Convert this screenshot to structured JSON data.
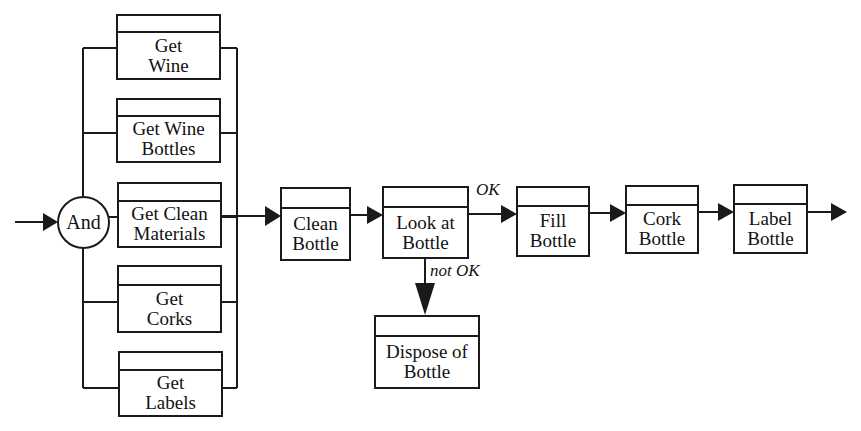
{
  "diagram": {
    "type": "process-flow",
    "join_node": {
      "label": "And"
    },
    "parallel_tasks": [
      {
        "id": "get-wine",
        "line1": "Get",
        "line2": "Wine"
      },
      {
        "id": "get-wine-bottles",
        "line1": "Get Wine",
        "line2": "Bottles"
      },
      {
        "id": "get-clean-materials",
        "line1": "Get Clean",
        "line2": "Materials"
      },
      {
        "id": "get-corks",
        "line1": "Get",
        "line2": "Corks"
      },
      {
        "id": "get-labels",
        "line1": "Get",
        "line2": "Labels"
      }
    ],
    "sequence": [
      {
        "id": "clean-bottle",
        "line1": "Clean",
        "line2": "Bottle"
      },
      {
        "id": "look-at-bottle",
        "line1": "Look at",
        "line2": "Bottle"
      },
      {
        "id": "fill-bottle",
        "line1": "Fill",
        "line2": "Bottle"
      },
      {
        "id": "cork-bottle",
        "line1": "Cork",
        "line2": "Bottle"
      },
      {
        "id": "label-bottle",
        "line1": "Label",
        "line2": "Bottle"
      }
    ],
    "branch": {
      "id": "dispose-of-bottle",
      "line1": "Dispose of",
      "line2": "Bottle"
    },
    "edge_labels": {
      "ok": "OK",
      "not_ok": "not OK"
    },
    "edges": [
      {
        "from": "start",
        "to": "And"
      },
      {
        "from": "And",
        "to": "get-wine"
      },
      {
        "from": "And",
        "to": "get-wine-bottles"
      },
      {
        "from": "And",
        "to": "get-clean-materials"
      },
      {
        "from": "And",
        "to": "get-corks"
      },
      {
        "from": "And",
        "to": "get-labels"
      },
      {
        "from": "parallel-join",
        "to": "clean-bottle"
      },
      {
        "from": "clean-bottle",
        "to": "look-at-bottle"
      },
      {
        "from": "look-at-bottle",
        "to": "fill-bottle",
        "label": "OK"
      },
      {
        "from": "look-at-bottle",
        "to": "dispose-of-bottle",
        "label": "not OK"
      },
      {
        "from": "fill-bottle",
        "to": "cork-bottle"
      },
      {
        "from": "cork-bottle",
        "to": "label-bottle"
      },
      {
        "from": "label-bottle",
        "to": "end"
      }
    ],
    "colors": {
      "stroke": "#1a1a1a",
      "background": "#ffffff",
      "text": "#111111"
    }
  }
}
